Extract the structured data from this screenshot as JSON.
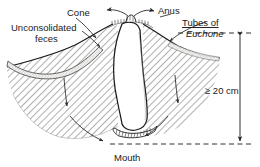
{
  "figure": {
    "background_color": "#ffffff",
    "ink_color": "#1a1a1a"
  },
  "labels": {
    "cone": "Cone",
    "unconsolidated_line1": "Unconsolidated",
    "unconsolidated_line2": "feces",
    "anus": "Anus",
    "tubes_of": "Tubes of",
    "euchone": "Euchone",
    "depth": "≥ 20 cm",
    "mouth": "Mouth"
  },
  "annotations": {
    "depth_value": "20",
    "depth_unit": "cm",
    "depth_qualifier": "≥"
  },
  "elements": {
    "burrow_tube": "burrow-tube",
    "sediment": "hatched-sediment",
    "feces_band": "stippled-feces-layer",
    "mouth_fringe": "mouth-tentacle-fringe",
    "anus_arrows": "ejection-arrows",
    "flow_arrows": "sediment-flow-arrows"
  }
}
